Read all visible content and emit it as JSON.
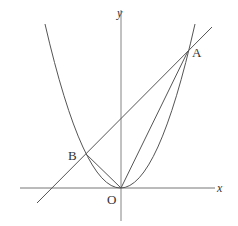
{
  "diagram": {
    "axes": {
      "x_label": "x",
      "y_label": "y",
      "origin_label": "O"
    },
    "points": [
      {
        "name": "A",
        "x": 188,
        "y": 51
      },
      {
        "name": "B",
        "x": 86,
        "y": 154
      },
      {
        "name": "O",
        "x": 121,
        "y": 188
      }
    ],
    "curves": [
      "parabola y = a x^2 through O, A, B",
      "line through A and B",
      "segment OA",
      "segment OB"
    ],
    "colors": {
      "stroke": "#555555",
      "text": "#333333"
    }
  }
}
